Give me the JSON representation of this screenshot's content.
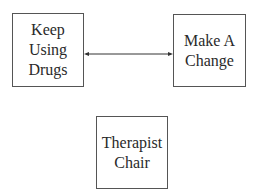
{
  "diagram": {
    "nodes": [
      {
        "id": "keep-using-drugs",
        "lines": [
          "Keep",
          "Using",
          "Drugs"
        ]
      },
      {
        "id": "make-a-change",
        "lines": [
          "Make A",
          "Change"
        ]
      },
      {
        "id": "therapist-chair",
        "lines": [
          "Therapist",
          "Chair"
        ]
      }
    ],
    "edges": [
      {
        "from": "keep-using-drugs",
        "to": "make-a-change",
        "type": "bidirectional-arrow"
      }
    ]
  }
}
